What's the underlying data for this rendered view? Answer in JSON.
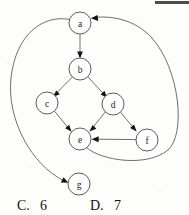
{
  "figure": {
    "type": "directed-graph",
    "title": "",
    "nodes": [
      {
        "id": "a",
        "label": "a",
        "cx": 80,
        "cy": 23,
        "r": 11
      },
      {
        "id": "b",
        "label": "b",
        "cx": 80,
        "cy": 69,
        "r": 11
      },
      {
        "id": "c",
        "label": "c",
        "cx": 47,
        "cy": 103,
        "r": 11
      },
      {
        "id": "d",
        "label": "d",
        "cx": 113,
        "cy": 104,
        "r": 11
      },
      {
        "id": "e",
        "label": "e",
        "cx": 80,
        "cy": 139,
        "r": 11
      },
      {
        "id": "f",
        "label": "f",
        "cx": 147,
        "cy": 140,
        "r": 11
      },
      {
        "id": "g",
        "label": "g",
        "cx": 79,
        "cy": 184,
        "r": 11
      }
    ],
    "edges": [
      {
        "from": "a",
        "to": "b",
        "shape": "straight"
      },
      {
        "from": "b",
        "to": "c",
        "shape": "straight"
      },
      {
        "from": "b",
        "to": "d",
        "shape": "straight"
      },
      {
        "from": "c",
        "to": "e",
        "shape": "straight"
      },
      {
        "from": "d",
        "to": "e",
        "shape": "straight"
      },
      {
        "from": "d",
        "to": "f",
        "shape": "straight"
      },
      {
        "from": "f",
        "to": "e",
        "shape": "straight"
      },
      {
        "from": "a",
        "to": "g",
        "shape": "curve-left"
      },
      {
        "from": "e",
        "to": "a",
        "shape": "curve-right"
      }
    ],
    "edge_count": 9
  },
  "answers": [
    {
      "key": "C.",
      "value": "6",
      "x": 17,
      "y": 210
    },
    {
      "key": "D.",
      "value": "7",
      "x": 90,
      "y": 210
    }
  ],
  "colors": {
    "node_stroke": "#4a4a4a",
    "edge_stroke": "#565656",
    "arrow_fill": "#131313",
    "text": "#131313",
    "page_background": "#fdfdfc",
    "scan_bar": "#4d4d4d"
  },
  "artifacts": {
    "scan_bar": {
      "x": 155,
      "y": 1,
      "width": 34,
      "height": 3
    }
  }
}
